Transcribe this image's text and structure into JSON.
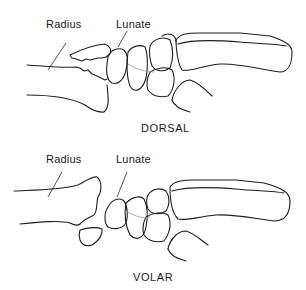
{
  "figure": {
    "panels": [
      {
        "id": "dorsal",
        "caption": "DORSAL",
        "labels": {
          "radius": "Radius",
          "lunate": "Lunate"
        }
      },
      {
        "id": "volar",
        "caption": "VOLAR",
        "labels": {
          "radius": "Radius",
          "lunate": "Lunate"
        }
      }
    ]
  }
}
